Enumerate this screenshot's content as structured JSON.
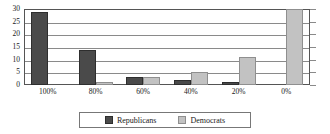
{
  "chart_data": {
    "type": "bar",
    "title": "",
    "xlabel": "",
    "ylabel": "",
    "ylim": [
      0,
      30
    ],
    "yticks": [
      0,
      5,
      10,
      15,
      20,
      25,
      30
    ],
    "ytick_labels": [
      "0",
      "5",
      "10",
      "15",
      "20",
      "25",
      "30"
    ],
    "grid": true,
    "legend_position": "bottom",
    "categories": [
      "100%",
      "80%",
      "60%",
      "40%",
      "20%",
      "0%"
    ],
    "series": [
      {
        "name": "Republicans",
        "color": "#4a4a4a",
        "values": [
          29,
          14,
          3,
          2,
          1,
          0
        ]
      },
      {
        "name": "Democrats",
        "color": "#c2c2c2",
        "values": [
          0,
          1,
          3,
          5,
          11,
          30
        ]
      }
    ]
  },
  "legend": {
    "entries": [
      {
        "label": "Republicans"
      },
      {
        "label": "Democrats"
      }
    ]
  }
}
